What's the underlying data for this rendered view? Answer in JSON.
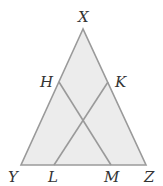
{
  "diagram": {
    "colors": {
      "fill": "#ececec",
      "stroke": "#9a9a9a",
      "label": "#333333"
    },
    "points": {
      "X": {
        "label": "X",
        "x": 83,
        "y": 29
      },
      "Y": {
        "label": "Y",
        "x": 21,
        "y": 165
      },
      "Z": {
        "label": "Z",
        "x": 146,
        "y": 165
      },
      "H": {
        "label": "H",
        "x": 59,
        "y": 82
      },
      "K": {
        "label": "K",
        "x": 108,
        "y": 82
      },
      "L": {
        "label": "L",
        "x": 54,
        "y": 165
      },
      "M": {
        "label": "M",
        "x": 111,
        "y": 165
      }
    },
    "segments": [
      "XY",
      "YZ",
      "ZX",
      "HM",
      "KL"
    ]
  }
}
